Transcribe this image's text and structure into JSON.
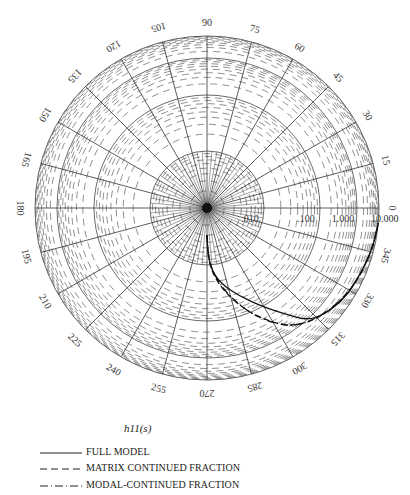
{
  "chart_data": {
    "type": "polar-log",
    "title": "h11(s)",
    "angular_axis": {
      "unit": "degrees",
      "ticks": [
        0,
        15,
        30,
        45,
        60,
        75,
        90,
        105,
        120,
        135,
        150,
        165,
        180,
        195,
        210,
        225,
        240,
        255,
        270,
        285,
        300,
        315,
        330,
        345
      ],
      "tick_labels": [
        "0",
        "15",
        "30",
        "45",
        "60",
        "75",
        "90",
        "105",
        "120",
        "135",
        "150",
        "165",
        "180",
        "195",
        "210",
        "225",
        "240",
        "255",
        "270",
        "285",
        "300",
        "315",
        "330",
        "345"
      ]
    },
    "radial_axis": {
      "scale": "log",
      "range": [
        0.001,
        10.0
      ],
      "ticks": [
        0.01,
        0.1,
        1.0,
        10.0
      ],
      "tick_labels": [
        ".010",
        ".100",
        "1.000",
        "10.000"
      ],
      "ring_radii_px": [
        0,
        57,
        113,
        150,
        172
      ]
    },
    "series": [
      {
        "name": "FULL MODEL",
        "style": "solid",
        "points": [
          {
            "angle": 270,
            "mag": 0.003
          },
          {
            "angle": 271,
            "mag": 0.006
          },
          {
            "angle": 274,
            "mag": 0.012
          },
          {
            "angle": 280,
            "mag": 0.022
          },
          {
            "angle": 290,
            "mag": 0.045
          },
          {
            "angle": 300,
            "mag": 0.11
          },
          {
            "angle": 306,
            "mag": 0.3
          },
          {
            "angle": 312,
            "mag": 1.2
          },
          {
            "angle": 320,
            "mag": 3.0
          },
          {
            "angle": 330,
            "mag": 5.5
          },
          {
            "angle": 345,
            "mag": 8.5
          },
          {
            "angle": 355,
            "mag": 10.0
          }
        ]
      },
      {
        "name": "MATRIX CONTINUED FRACTION",
        "style": "dashed",
        "points": [
          {
            "angle": 270,
            "mag": 0.003
          },
          {
            "angle": 271,
            "mag": 0.006
          },
          {
            "angle": 274,
            "mag": 0.013
          },
          {
            "angle": 281,
            "mag": 0.03
          },
          {
            "angle": 290,
            "mag": 0.08
          },
          {
            "angle": 298,
            "mag": 0.25
          },
          {
            "angle": 305,
            "mag": 0.7
          },
          {
            "angle": 313,
            "mag": 1.6
          },
          {
            "angle": 322,
            "mag": 3.2
          },
          {
            "angle": 332,
            "mag": 5.6
          },
          {
            "angle": 345,
            "mag": 8.5
          },
          {
            "angle": 355,
            "mag": 10.0
          }
        ]
      },
      {
        "name": "MODAL-CONTINUED FRACTION",
        "style": "dash-dot",
        "points": [
          {
            "angle": 270,
            "mag": 0.003
          },
          {
            "angle": 271,
            "mag": 0.006
          },
          {
            "angle": 274,
            "mag": 0.012
          },
          {
            "angle": 282,
            "mag": 0.032
          },
          {
            "angle": 291,
            "mag": 0.09
          },
          {
            "angle": 299,
            "mag": 0.3
          },
          {
            "angle": 306,
            "mag": 0.8
          },
          {
            "angle": 314,
            "mag": 1.7
          },
          {
            "angle": 323,
            "mag": 3.3
          },
          {
            "angle": 333,
            "mag": 5.7
          },
          {
            "angle": 345,
            "mag": 8.5
          },
          {
            "angle": 355,
            "mag": 10.0
          }
        ]
      }
    ],
    "legend": {
      "position": "bottom-left",
      "entries": [
        "FULL MODEL",
        "MATRIX CONTINUED FRACTION",
        "MODAL-CONTINUED FRACTION"
      ]
    },
    "grid": true
  },
  "legend": {
    "title": "h11(s)",
    "items": [
      {
        "label": "FULL MODEL",
        "style": "solid"
      },
      {
        "label": "MATRIX CONTINUED FRACTION",
        "style": "dashed"
      },
      {
        "label": "MODAL-CONTINUED FRACTION",
        "style": "dash-dot"
      }
    ]
  }
}
